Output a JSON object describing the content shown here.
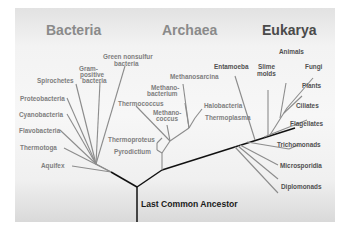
{
  "diagram": {
    "domains": [
      {
        "label": "Bacteria",
        "color": "#8a8a8a"
      },
      {
        "label": "Archaea",
        "color": "#8a8a8a"
      },
      {
        "label": "Eukarya",
        "color": "#4a4a4a"
      }
    ],
    "root_label": "Last Common Ancestor",
    "bacteria": [
      "Green nonsulfur",
      "bacteria",
      "Gram-",
      "positive",
      "bacteria",
      "Spirochetes",
      "Proteobacteria",
      "Cyanobacteria",
      "Flavobacteria",
      "Thermotoga",
      "Aquifex"
    ],
    "archaea": [
      "Methanosarcina",
      "Methano-",
      "bacterium",
      "Halobacteria",
      "Thermococcus",
      "Methano-",
      "coccus",
      "Thermoplasma",
      "Thermoproteus",
      "Pyrodictium"
    ],
    "eukarya": [
      "Animals",
      "Entamoeba",
      "Slime",
      "molds",
      "Fungi",
      "Plants",
      "Ciliates",
      "Flagellates",
      "Trichomonads",
      "Microsporidia",
      "Diplomonads"
    ],
    "colors": {
      "branch_light": "#8c8c8c",
      "branch_dark": "#111111",
      "background_panel": "#f3f3f3"
    }
  }
}
